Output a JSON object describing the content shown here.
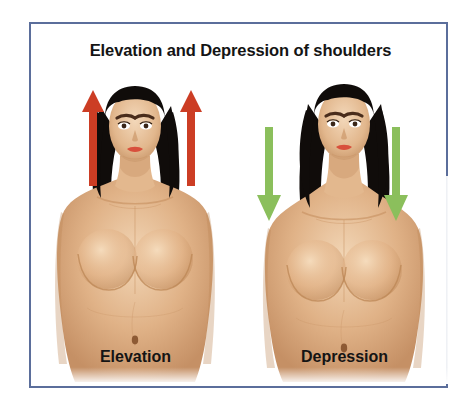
{
  "figure": {
    "title": "Elevation and Depression of shoulders",
    "border_color": "#5b6e9b",
    "background_color": "#ffffff"
  },
  "panels": [
    {
      "id": "elevation",
      "caption": "Elevation",
      "arrow_direction": "up",
      "arrow_color": "#cc3d24",
      "arrow_count": 2,
      "subject": "female-torso-shoulders-raised"
    },
    {
      "id": "depression",
      "caption": "Depression",
      "arrow_direction": "down",
      "arrow_color": "#8bbf5c",
      "arrow_count": 2,
      "subject": "female-torso-shoulders-lowered"
    }
  ],
  "palette": {
    "skin_light": "#f0d3b4",
    "skin_mid": "#dcab7d",
    "skin_shadow": "#c08f62",
    "hair": "#100c0a",
    "lips": "#d8503c",
    "brow": "#4a2d1c",
    "navel": "#8d5a34"
  }
}
